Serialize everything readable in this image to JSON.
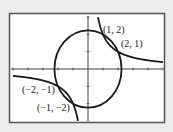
{
  "chart_data": {
    "type": "line",
    "title": "",
    "xlabel": "",
    "ylabel": "",
    "xlim": [
      -5,
      5
    ],
    "ylim": [
      -3,
      3
    ],
    "grid": false,
    "series": [
      {
        "name": "circle x^2 + y^2 = 5",
        "kind": "circle",
        "radius": 2.236
      },
      {
        "name": "hyperbola xy = 2",
        "kind": "hyperbola",
        "k": 2
      }
    ],
    "annotations": [
      {
        "text": "(1, 2)",
        "x": 1,
        "y": 2
      },
      {
        "text": "(2, 1)",
        "x": 2,
        "y": 1
      },
      {
        "text": "(−2, −1)",
        "x": -2,
        "y": -1
      },
      {
        "text": "(−1, −2)",
        "x": -1,
        "y": -2
      }
    ]
  },
  "labels": {
    "p1": "(1, 2)",
    "p2": "(2, 1)",
    "p3": "(−2, −1)",
    "p4": "(−1, −2)"
  },
  "colors": {
    "background": "#ececec",
    "plot_background": "#ffffff",
    "frame": "#555555",
    "curve": "#1a1a1a"
  }
}
